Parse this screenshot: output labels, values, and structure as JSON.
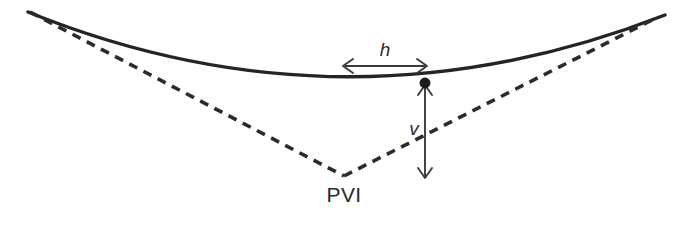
{
  "diagram": {
    "background_color": "#ffffff",
    "stroke_color": "#242424",
    "dash_color": "#2b2b2b",
    "dim_color": "#3a3a3a",
    "labels": {
      "pvi": "PVI",
      "horizontal_offset": "h",
      "vertical_offset": "v"
    },
    "geometry": {
      "curve_path": "M 28 12 Q 345 140 665 15",
      "tangent_left_path": "M 30 12 L 344 176",
      "tangent_right_path": "M 344 176 L 658 17",
      "pvi_point": [
        344,
        176
      ],
      "curve_point": [
        425,
        83
      ],
      "h_arrow": {
        "x1": 343,
        "x2": 427,
        "y": 66
      },
      "v_arrow": {
        "x": 425,
        "y1": 85,
        "y2": 178
      }
    },
    "label_positions": {
      "pvi": [
        344,
        202
      ],
      "h": [
        385,
        56
      ],
      "v": [
        414,
        135
      ]
    }
  }
}
